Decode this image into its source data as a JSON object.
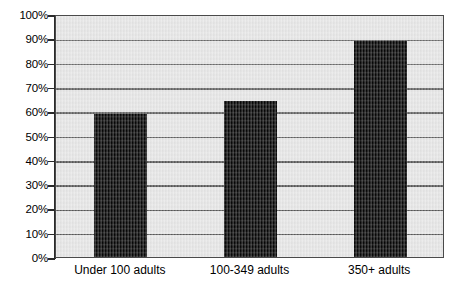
{
  "chart_data": {
    "type": "bar",
    "title": "",
    "subtitle": "",
    "xlabel": "",
    "ylabel": "",
    "categories": [
      "Under 100 adults",
      "100-349 adults",
      "350+ adults"
    ],
    "values": [
      59,
      64,
      89
    ],
    "value_labels": [
      "59%",
      "64%",
      "89%"
    ],
    "ylim": [
      0,
      100
    ],
    "ytick_values": [
      0,
      10,
      20,
      30,
      40,
      50,
      60,
      70,
      80,
      90,
      100
    ],
    "ytick_labels": [
      "0%",
      "10%",
      "20%",
      "30%",
      "40%",
      "50%",
      "60%",
      "70%",
      "80%",
      "90%",
      "100%"
    ],
    "grid": true,
    "grid_axis": "y",
    "legend": false,
    "legend_position": "none",
    "series": [
      {
        "name": "",
        "values": [
          59,
          64,
          89
        ]
      }
    ],
    "colors": {
      "bar": "#000000",
      "plot_background": "#e6e6e6",
      "gridline": "#555555",
      "axis": "#2b2b2b",
      "text": "#000000",
      "page_background": "#ffffff"
    }
  }
}
